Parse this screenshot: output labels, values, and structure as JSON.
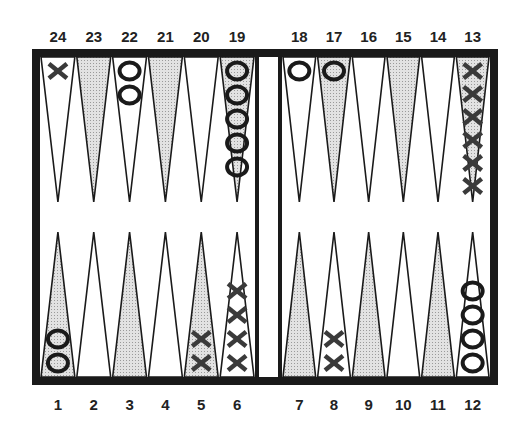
{
  "colors": {
    "frame": "#1a1a1a",
    "shaded_point": "#cfcfcf",
    "plain_point": "#ffffff",
    "checker_x": "#3a3a3a",
    "checker_o": "#1a1a1a"
  },
  "top_labels": [
    "24",
    "23",
    "22",
    "21",
    "20",
    "19",
    "18",
    "17",
    "16",
    "15",
    "14",
    "13"
  ],
  "bottom_labels": [
    "1",
    "2",
    "3",
    "4",
    "5",
    "6",
    "7",
    "8",
    "9",
    "10",
    "11",
    "12"
  ],
  "points": [
    {
      "point": 1,
      "player": "O",
      "count": 2,
      "shaded": true
    },
    {
      "point": 2,
      "player": "",
      "count": 0,
      "shaded": false
    },
    {
      "point": 3,
      "player": "",
      "count": 0,
      "shaded": true
    },
    {
      "point": 4,
      "player": "",
      "count": 0,
      "shaded": false
    },
    {
      "point": 5,
      "player": "X",
      "count": 2,
      "shaded": true
    },
    {
      "point": 6,
      "player": "X",
      "count": 4,
      "shaded": false
    },
    {
      "point": 7,
      "player": "",
      "count": 0,
      "shaded": true
    },
    {
      "point": 8,
      "player": "X",
      "count": 2,
      "shaded": false
    },
    {
      "point": 9,
      "player": "",
      "count": 0,
      "shaded": true
    },
    {
      "point": 10,
      "player": "",
      "count": 0,
      "shaded": false
    },
    {
      "point": 11,
      "player": "",
      "count": 0,
      "shaded": true
    },
    {
      "point": 12,
      "player": "O",
      "count": 4,
      "shaded": false
    },
    {
      "point": 13,
      "player": "X",
      "count": 6,
      "shaded": true
    },
    {
      "point": 14,
      "player": "",
      "count": 0,
      "shaded": false
    },
    {
      "point": 15,
      "player": "",
      "count": 0,
      "shaded": true
    },
    {
      "point": 16,
      "player": "",
      "count": 0,
      "shaded": false
    },
    {
      "point": 17,
      "player": "O",
      "count": 1,
      "shaded": true
    },
    {
      "point": 18,
      "player": "O",
      "count": 1,
      "shaded": false
    },
    {
      "point": 19,
      "player": "O",
      "count": 5,
      "shaded": true
    },
    {
      "point": 20,
      "player": "",
      "count": 0,
      "shaded": false
    },
    {
      "point": 21,
      "player": "",
      "count": 0,
      "shaded": true
    },
    {
      "point": 22,
      "player": "O",
      "count": 2,
      "shaded": false
    },
    {
      "point": 23,
      "player": "",
      "count": 0,
      "shaded": true
    },
    {
      "point": 24,
      "player": "X",
      "count": 1,
      "shaded": false
    }
  ],
  "checker_symbols": {
    "X": "X",
    "O": "O"
  }
}
